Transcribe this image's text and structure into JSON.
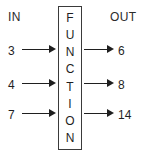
{
  "diagram": {
    "headers": {
      "input_label": "IN",
      "output_label": "OUT"
    },
    "machine": {
      "label": "FUNCTION",
      "letters": [
        "F",
        "U",
        "N",
        "C",
        "T",
        "I",
        "O",
        "N"
      ],
      "border_color": "#3a3a3a",
      "fill_color": "#ffffff"
    },
    "arrow_color": "#1f1f1f",
    "text_color": "#1f1f1f",
    "background_color": "#ffffff",
    "rows": [
      {
        "input": "3",
        "output": "6"
      },
      {
        "input": "4",
        "output": "8"
      },
      {
        "input": "7",
        "output": "14"
      }
    ]
  },
  "chart_data": {
    "type": "table",
    "columns": [
      "IN",
      "OUT"
    ],
    "rows": [
      [
        "3",
        "6"
      ],
      [
        "4",
        "8"
      ],
      [
        "7",
        "14"
      ]
    ],
    "xlabel": "IN",
    "ylabel": "OUT"
  }
}
